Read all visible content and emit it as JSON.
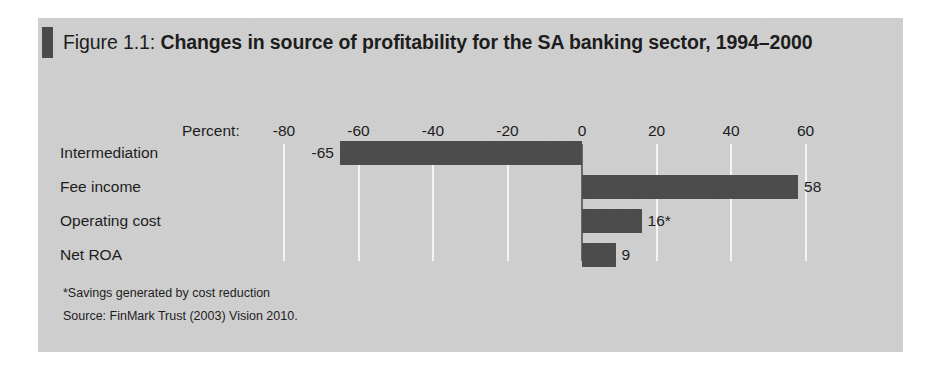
{
  "figure": {
    "title_prefix": "Figure 1.1: ",
    "title_main": "Changes in source of profitability for the SA banking sector, 1994–2000",
    "marker_color": "#4a4a4a",
    "panel_color": "#d2d2d2",
    "bar_color": "#4a4a4a",
    "gridline_color": "#f4f4f4",
    "zeroline_color": "#6b6b6b",
    "text_color": "#1d1d1d"
  },
  "axis": {
    "unit_label": "Percent:",
    "ticks": [
      "-80",
      "-60",
      "-40",
      "-20",
      "0",
      "20",
      "40",
      "60"
    ]
  },
  "notes": {
    "footnote": "*Savings generated by cost reduction",
    "source": "Source: FinMark Trust (2003) Vision 2010."
  },
  "chart_data": {
    "type": "bar",
    "orientation": "horizontal",
    "title": "Figure 1.1: Changes in source of profitability for the SA banking sector, 1994–2000",
    "xlabel": "Percent:",
    "ylabel": "",
    "xlim": [
      -80,
      60
    ],
    "xticks": [
      -80,
      -60,
      -40,
      -20,
      0,
      20,
      40,
      60
    ],
    "grid": true,
    "legend": false,
    "categories": [
      "Intermediation",
      "Fee income",
      "Operating cost",
      "Net ROA"
    ],
    "values": [
      -65,
      58,
      16,
      9
    ],
    "data_labels": [
      "-65",
      "58",
      "16*",
      "9"
    ],
    "annotations": [
      "*Savings generated by cost reduction",
      "Source: FinMark Trust (2003) Vision 2010."
    ]
  }
}
